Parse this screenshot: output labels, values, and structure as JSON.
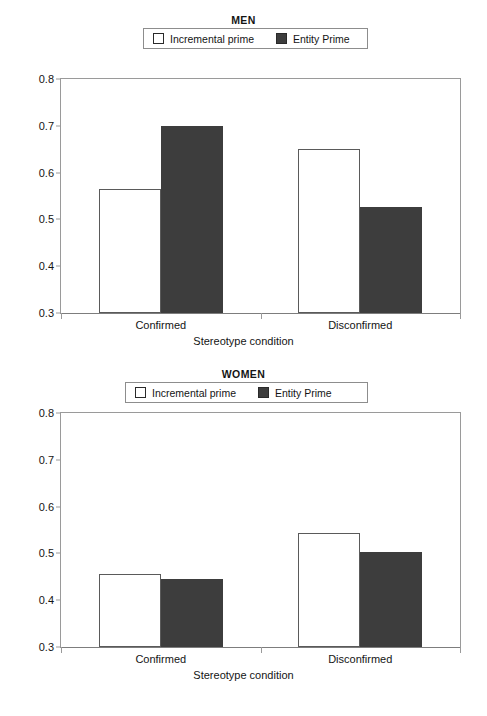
{
  "chart_data": [
    {
      "type": "bar",
      "title": "MEN",
      "xlabel": "Stereotype condition",
      "ylabel": "",
      "categories": [
        "Confirmed",
        "Disconfirmed"
      ],
      "series": [
        {
          "name": "Incremental prime",
          "values": [
            0.565,
            0.65
          ],
          "swatch": "open"
        },
        {
          "name": "Entity Prime",
          "values": [
            0.7,
            0.527
          ],
          "swatch": "solid"
        }
      ],
      "ylim": [
        0.3,
        0.8
      ],
      "yticks": [
        "0.3",
        "0.4",
        "0.5",
        "0.6",
        "0.7",
        "0.8"
      ],
      "ytick_values": [
        0.3,
        0.4,
        0.5,
        0.6,
        0.7,
        0.8
      ],
      "grid": false,
      "legend_position": "top"
    },
    {
      "type": "bar",
      "title": "WOMEN",
      "xlabel": "Stereotype condition",
      "ylabel": "",
      "categories": [
        "Confirmed",
        "Disconfirmed"
      ],
      "series": [
        {
          "name": "Incremental prime",
          "values": [
            0.457,
            0.543
          ],
          "swatch": "open"
        },
        {
          "name": "Entity Prime",
          "values": [
            0.445,
            0.503
          ],
          "swatch": "solid"
        }
      ],
      "ylim": [
        0.3,
        0.8
      ],
      "yticks": [
        "0.3",
        "0.4",
        "0.5",
        "0.6",
        "0.7",
        "0.8"
      ],
      "ytick_values": [
        0.3,
        0.4,
        0.5,
        0.6,
        0.7,
        0.8
      ],
      "grid": false,
      "legend_position": "top"
    }
  ],
  "colors": {
    "incremental_prime": "#ffffff",
    "entity_prime": "#3d3d3d",
    "axis": "#9a9a9a",
    "text": "#141414"
  }
}
